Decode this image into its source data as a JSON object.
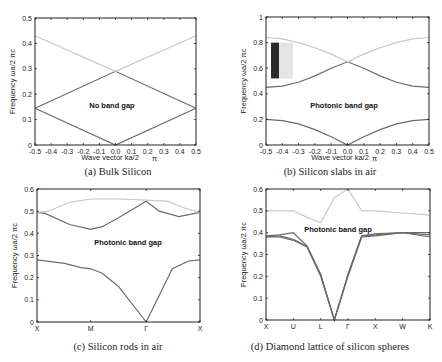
{
  "chart_data": [
    {
      "type": "line",
      "caption": "(a) Bulk Silicon",
      "annotation": "No band gap",
      "xlabel": "Wave vector ka/2",
      "xlabel_suffix": "π",
      "ylabel": "Frequency",
      "ylabel_suffix": "ωa/2 πc",
      "xlim": [
        -0.5,
        0.5
      ],
      "ylim": [
        0,
        0.5
      ],
      "xticks": [
        "-0.5",
        "-0.4",
        "-0.3",
        "-0.2",
        "-0.1",
        "0.0",
        "0.1",
        "0.2",
        "0.3",
        "0.4",
        "0.5"
      ],
      "yticks": [
        "0",
        "0.1",
        "0.2",
        "0.3",
        "0.4",
        "0.5"
      ],
      "series": [
        {
          "name": "band1",
          "color": "#6b6b6b",
          "x": [
            -0.5,
            0.0,
            0.5
          ],
          "y": [
            0.145,
            0.0,
            0.145
          ]
        },
        {
          "name": "band2",
          "color": "#6b6b6b",
          "x": [
            -0.5,
            0.0,
            0.5
          ],
          "y": [
            0.145,
            0.29,
            0.145
          ]
        },
        {
          "name": "band3",
          "color": "#c8c8c8",
          "x": [
            -0.5,
            0.0,
            0.5
          ],
          "y": [
            0.43,
            0.29,
            0.43
          ]
        }
      ]
    },
    {
      "type": "line",
      "caption": "(b) Silicon slabs in air",
      "annotation": "Photonic band gap",
      "xlabel": "Wave vector ka/2",
      "xlabel_suffix": "π",
      "ylabel": "Frequency",
      "ylabel_suffix": "ωa/2 πc",
      "xlim": [
        -0.5,
        0.5
      ],
      "ylim": [
        0,
        1
      ],
      "xticks": [
        "-0.5",
        "-0.4",
        "-0.3",
        "-0.2",
        "-0.1",
        "0.0",
        "0.1",
        "0.2",
        "0.3",
        "0.4",
        "0.5"
      ],
      "yticks": [
        "0",
        "0.2",
        "0.4",
        "0.6",
        "0.8",
        "1"
      ],
      "inset": {
        "dark_color": "#2a2a2a",
        "light_color": "#e4e4e4",
        "y_range": [
          0.52,
          0.8
        ]
      },
      "series": [
        {
          "name": "band1",
          "color": "#6b6b6b",
          "x": [
            -0.5,
            -0.4,
            -0.3,
            -0.2,
            -0.1,
            0.0,
            0.1,
            0.2,
            0.3,
            0.4,
            0.5
          ],
          "y": [
            0.2,
            0.19,
            0.165,
            0.12,
            0.065,
            0.0,
            0.065,
            0.12,
            0.165,
            0.19,
            0.2
          ]
        },
        {
          "name": "band2",
          "color": "#6b6b6b",
          "x": [
            -0.5,
            -0.4,
            -0.3,
            -0.2,
            -0.1,
            0.0,
            0.1,
            0.2,
            0.3,
            0.4,
            0.5
          ],
          "y": [
            0.45,
            0.46,
            0.49,
            0.54,
            0.6,
            0.65,
            0.6,
            0.54,
            0.49,
            0.46,
            0.45
          ]
        },
        {
          "name": "band3",
          "color": "#c8c8c8",
          "x": [
            -0.5,
            -0.4,
            -0.3,
            -0.2,
            -0.1,
            0.0,
            0.1,
            0.2,
            0.3,
            0.4,
            0.5
          ],
          "y": [
            0.84,
            0.83,
            0.8,
            0.76,
            0.71,
            0.65,
            0.71,
            0.76,
            0.8,
            0.83,
            0.84
          ]
        }
      ]
    },
    {
      "type": "line",
      "caption": "(c) Silicon rods in air",
      "annotation": "Photonic band gap",
      "xlabel": "",
      "ylabel": "Frequency",
      "ylabel_suffix": "ωa/2 πc",
      "ylim": [
        0,
        0.6
      ],
      "xticks": [
        "X",
        "M",
        "Γ",
        "X"
      ],
      "yticks": [
        "0",
        "0.1",
        "0.2",
        "0.3",
        "0.4",
        "0.5",
        "0.6"
      ],
      "series": [
        {
          "name": "band1",
          "color": "#6b6b6b",
          "x": [
            0,
            0.17,
            0.27,
            0.33,
            0.4,
            0.5,
            0.67,
            0.83,
            0.93,
            1.0
          ],
          "y": [
            0.28,
            0.265,
            0.245,
            0.24,
            0.22,
            0.16,
            0.0,
            0.24,
            0.275,
            0.28
          ]
        },
        {
          "name": "band2",
          "color": "#6b6b6b",
          "x": [
            0,
            0.05,
            0.2,
            0.33,
            0.4,
            0.5,
            0.67,
            0.75,
            0.87,
            1.0
          ],
          "y": [
            0.495,
            0.49,
            0.44,
            0.418,
            0.43,
            0.47,
            0.545,
            0.5,
            0.475,
            0.495
          ]
        },
        {
          "name": "band3",
          "color": "#c8c8c8",
          "x": [
            0,
            0.07,
            0.2,
            0.33,
            0.5,
            0.67,
            0.8,
            0.9,
            1.0
          ],
          "y": [
            0.495,
            0.5,
            0.54,
            0.555,
            0.555,
            0.55,
            0.545,
            0.515,
            0.495
          ]
        }
      ]
    },
    {
      "type": "line",
      "caption": "(d) Diamond lattice of silicon spheres",
      "annotation": "Photonic band gap",
      "xlabel": "",
      "ylabel": "Frequency",
      "ylabel_suffix": "ωa/2 πc",
      "ylim": [
        0,
        0.6
      ],
      "xticks": [
        "X",
        "U",
        "L",
        "Γ",
        "X",
        "W",
        "K"
      ],
      "yticks": [
        "0",
        "0.1",
        "0.2",
        "0.3",
        "0.4",
        "0.5",
        "0.6"
      ],
      "series": [
        {
          "name": "band1",
          "color": "#6b6b6b",
          "x": [
            0,
            0.5,
            1,
            1.5,
            2,
            2.5,
            3,
            3.5,
            4,
            5,
            6
          ],
          "y": [
            0.38,
            0.38,
            0.365,
            0.335,
            0.2,
            0.0,
            0.2,
            0.38,
            0.385,
            0.4,
            0.38
          ]
        },
        {
          "name": "band2",
          "color": "#6b6b6b",
          "x": [
            0,
            0.5,
            1,
            1.5,
            2,
            2.5,
            3,
            3.5,
            4,
            5,
            6
          ],
          "y": [
            0.38,
            0.385,
            0.37,
            0.338,
            0.205,
            0.0,
            0.205,
            0.385,
            0.39,
            0.4,
            0.39
          ]
        },
        {
          "name": "band3",
          "color": "#6b6b6b",
          "x": [
            0,
            0.5,
            1,
            1.5,
            2,
            2.5,
            3,
            3.5,
            4,
            5,
            6
          ],
          "y": [
            0.385,
            0.39,
            0.4,
            0.34,
            0.21,
            0.0,
            0.21,
            0.385,
            0.395,
            0.4,
            0.4
          ]
        },
        {
          "name": "band4",
          "color": "#c8c8c8",
          "x": [
            0,
            0.5,
            1,
            1.5,
            2,
            2.5,
            3,
            3.5,
            4,
            5,
            6
          ],
          "y": [
            0.5,
            0.5,
            0.5,
            0.47,
            0.445,
            0.56,
            0.6,
            0.5,
            0.5,
            0.49,
            0.48
          ]
        }
      ]
    }
  ]
}
